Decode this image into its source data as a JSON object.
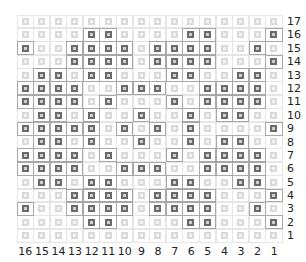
{
  "chart_data": {
    "type": "heatmap",
    "title": "",
    "columns": [
      "16",
      "15",
      "14",
      "13",
      "12",
      "11",
      "10",
      "9",
      "8",
      "7",
      "6",
      "5",
      "4",
      "3",
      "2",
      "1"
    ],
    "rows": [
      {
        "label": "17",
        "cells": "0000000000000000"
      },
      {
        "label": "16",
        "cells": "0000110000110001"
      },
      {
        "label": "15",
        "cells": "1001111011110010"
      },
      {
        "label": "14",
        "cells": "0001111011110001"
      },
      {
        "label": "13",
        "cells": "0110110001100110"
      },
      {
        "label": "12",
        "cells": "1111001110011110"
      },
      {
        "label": "11",
        "cells": "1111010001011110"
      },
      {
        "label": "10",
        "cells": "0110100100101100"
      },
      {
        "label": "9",
        "cells": "1111101010100001"
      },
      {
        "label": "8",
        "cells": "0110100100101100"
      },
      {
        "label": "7",
        "cells": "1111010001011110"
      },
      {
        "label": "6",
        "cells": "1111001110011110"
      },
      {
        "label": "5",
        "cells": "0110110001100110"
      },
      {
        "label": "4",
        "cells": "0001111011110001"
      },
      {
        "label": "3",
        "cells": "1001111011110010"
      },
      {
        "label": "2",
        "cells": "0000110000110001"
      },
      {
        "label": "1",
        "cells": "0000000000000000"
      }
    ],
    "legend": {
      "dark": "#6a6a6a",
      "light": "#dadada"
    },
    "xlabel": "",
    "ylabel": "",
    "grid": true
  }
}
